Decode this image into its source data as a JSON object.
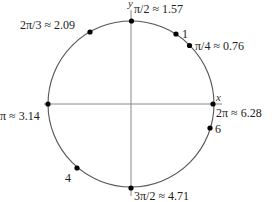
{
  "diagram": {
    "type": "unit-circle",
    "center": [
      131,
      104
    ],
    "radius": 83,
    "axes": {
      "x_label": "x",
      "y_label": "y"
    },
    "colors": {
      "circle": "#555555",
      "axis": "#888888",
      "point": "#000000",
      "text": "#222222"
    },
    "points": [
      {
        "id": "pi-over-2",
        "angle": 1.5708,
        "label": "π/2 ≈ 1.57"
      },
      {
        "id": "one",
        "angle": 1.0,
        "label": "1"
      },
      {
        "id": "pi-over-4",
        "angle": 0.7854,
        "label": "π/4 ≈ 0.76"
      },
      {
        "id": "two-pi-over-3",
        "angle": 2.0944,
        "label": "2π/3 ≈ 2.09"
      },
      {
        "id": "pi",
        "angle": 3.1416,
        "label": "π ≈ 3.14"
      },
      {
        "id": "four",
        "angle": 4.0,
        "label": "4"
      },
      {
        "id": "three-pi-over-2",
        "angle": 4.7124,
        "label": "3π/2 ≈ 4.71"
      },
      {
        "id": "six",
        "angle": 6.0,
        "label": "6"
      },
      {
        "id": "two-pi",
        "angle": 6.2832,
        "label": "2π ≈ 6.28"
      }
    ]
  }
}
